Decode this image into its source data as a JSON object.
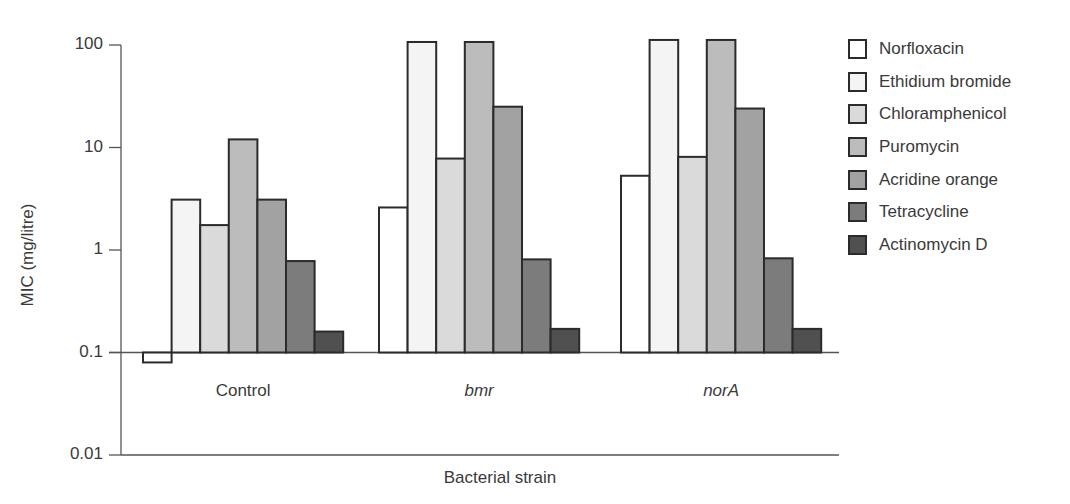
{
  "chart_data": {
    "type": "bar",
    "title": "",
    "xlabel": "Bacterial strain",
    "ylabel": "MIC (mg/litre)",
    "yscale": "log",
    "ylim": [
      0.01,
      100
    ],
    "yticks": [
      "100",
      "10",
      "1",
      "0.1",
      "0.01"
    ],
    "baseline": 0.1,
    "grid": false,
    "legend_position": "right",
    "categories": [
      "Control",
      "bmr",
      "norA"
    ],
    "category_italic": [
      false,
      true,
      true
    ],
    "series": [
      {
        "name": "Norfloxacin",
        "color": "#ffffff",
        "values": [
          0.08,
          2.6,
          5.3
        ]
      },
      {
        "name": "Ethidium bromide",
        "color": "#f4f4f4",
        "values": [
          3.1,
          107,
          112
        ]
      },
      {
        "name": "Chloramphenicol",
        "color": "#dadada",
        "values": [
          1.75,
          7.8,
          8.1
        ]
      },
      {
        "name": "Puromycin",
        "color": "#bcbcbc",
        "values": [
          12,
          107,
          112
        ]
      },
      {
        "name": "Acridine orange",
        "color": "#a2a2a2",
        "values": [
          3.1,
          25,
          24
        ]
      },
      {
        "name": "Tetracycline",
        "color": "#7c7c7c",
        "values": [
          0.78,
          0.81,
          0.83
        ]
      },
      {
        "name": "Actinomycin D",
        "color": "#505050",
        "values": [
          0.16,
          0.17,
          0.17
        ]
      }
    ]
  }
}
